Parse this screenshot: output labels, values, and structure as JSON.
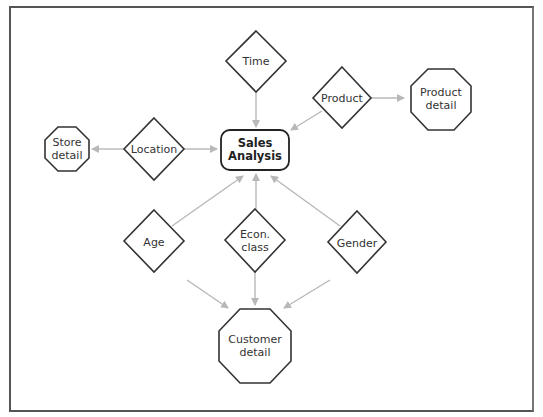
{
  "diagram": {
    "title": "Sales Analysis",
    "colors": {
      "frame": "#555555",
      "node_stroke": "#333333",
      "arrow": "#b8b8b8",
      "text": "#333333",
      "background": "#ffffff"
    },
    "nodes": [
      {
        "id": "sales",
        "shape": "rounded-rect",
        "label_lines": [
          "Sales",
          "Analysis"
        ],
        "bold": true
      },
      {
        "id": "time",
        "shape": "diamond",
        "label_lines": [
          "Time"
        ]
      },
      {
        "id": "product",
        "shape": "diamond",
        "label_lines": [
          "Product"
        ]
      },
      {
        "id": "product_detail",
        "shape": "octagon",
        "label_lines": [
          "Product",
          "detail"
        ]
      },
      {
        "id": "location",
        "shape": "diamond",
        "label_lines": [
          "Location"
        ]
      },
      {
        "id": "store_detail",
        "shape": "octagon",
        "label_lines": [
          "Store",
          "detail"
        ]
      },
      {
        "id": "age",
        "shape": "diamond",
        "label_lines": [
          "Age"
        ]
      },
      {
        "id": "econ_class",
        "shape": "diamond",
        "label_lines": [
          "Econ.",
          "class"
        ]
      },
      {
        "id": "gender",
        "shape": "diamond",
        "label_lines": [
          "Gender"
        ]
      },
      {
        "id": "customer_detail",
        "shape": "octagon",
        "label_lines": [
          "Customer",
          "detail"
        ]
      }
    ],
    "edges": [
      {
        "from": "time",
        "to": "sales"
      },
      {
        "from": "product",
        "to": "sales"
      },
      {
        "from": "product",
        "to": "product_detail"
      },
      {
        "from": "location",
        "to": "sales"
      },
      {
        "from": "location",
        "to": "store_detail"
      },
      {
        "from": "age",
        "to": "sales"
      },
      {
        "from": "econ_class",
        "to": "sales"
      },
      {
        "from": "gender",
        "to": "sales"
      },
      {
        "from": "age",
        "to": "customer_detail"
      },
      {
        "from": "econ_class",
        "to": "customer_detail"
      },
      {
        "from": "gender",
        "to": "customer_detail"
      }
    ],
    "labels": {
      "sales_1": "Sales",
      "sales_2": "Analysis",
      "time": "Time",
      "product": "Product",
      "product_detail_1": "Product",
      "product_detail_2": "detail",
      "location": "Location",
      "store_detail_1": "Store",
      "store_detail_2": "detail",
      "age": "Age",
      "econ_class_1": "Econ.",
      "econ_class_2": "class",
      "gender": "Gender",
      "customer_detail_1": "Customer",
      "customer_detail_2": "detail"
    }
  }
}
